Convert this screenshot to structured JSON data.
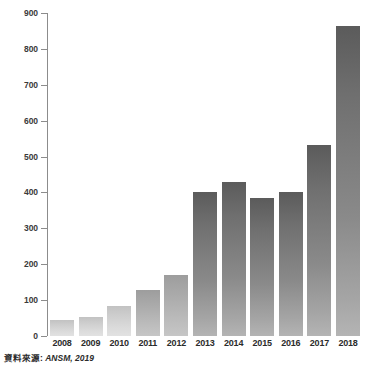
{
  "chart_data": {
    "type": "bar",
    "title": "",
    "xlabel": "",
    "ylabel": "",
    "categories": [
      "2008",
      "2009",
      "2010",
      "2011",
      "2012",
      "2013",
      "2014",
      "2015",
      "2016",
      "2017",
      "2018"
    ],
    "values": [
      45,
      53,
      85,
      128,
      170,
      400,
      430,
      385,
      400,
      532,
      865
    ],
    "ylim": [
      0,
      900
    ],
    "y_ticks": [
      0,
      100,
      200,
      300,
      400,
      500,
      600,
      700,
      800,
      900
    ],
    "y_tick_labels": [
      "0",
      "100",
      "200",
      "300",
      "400",
      "500",
      "600",
      "700",
      "800",
      "900"
    ],
    "grid": false,
    "legend": null,
    "bar_fill": "#7a7a7a",
    "axis_color": "#8c8c8c",
    "text_color": "#2b2b2b"
  },
  "source": {
    "prefix": "資料來源:",
    "value": "ANSM, 2019"
  }
}
